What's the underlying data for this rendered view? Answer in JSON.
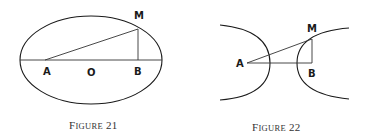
{
  "figures": [
    {
      "id": "figure-21",
      "caption": {
        "first": "F",
        "rest": "IGURE",
        "number": "21"
      },
      "shape": "ellipse",
      "points": {
        "A": "A",
        "O": "O",
        "B": "B",
        "M": "M"
      },
      "geometry": {
        "ellipse": {
          "cx": 91,
          "cy": 60,
          "rx": 71,
          "ry": 44
        },
        "A": [
          45,
          60
        ],
        "B": [
          138,
          60
        ],
        "M": [
          138,
          29
        ]
      }
    },
    {
      "id": "figure-22",
      "caption": {
        "first": "F",
        "rest": "IGURE",
        "number": "22"
      },
      "shape": "hyperbola",
      "points": {
        "A": "A",
        "B": "B",
        "M": "M"
      },
      "geometry": {
        "A": [
          247,
          63
        ],
        "B": [
          312,
          63
        ],
        "M": [
          312,
          39
        ]
      }
    }
  ]
}
